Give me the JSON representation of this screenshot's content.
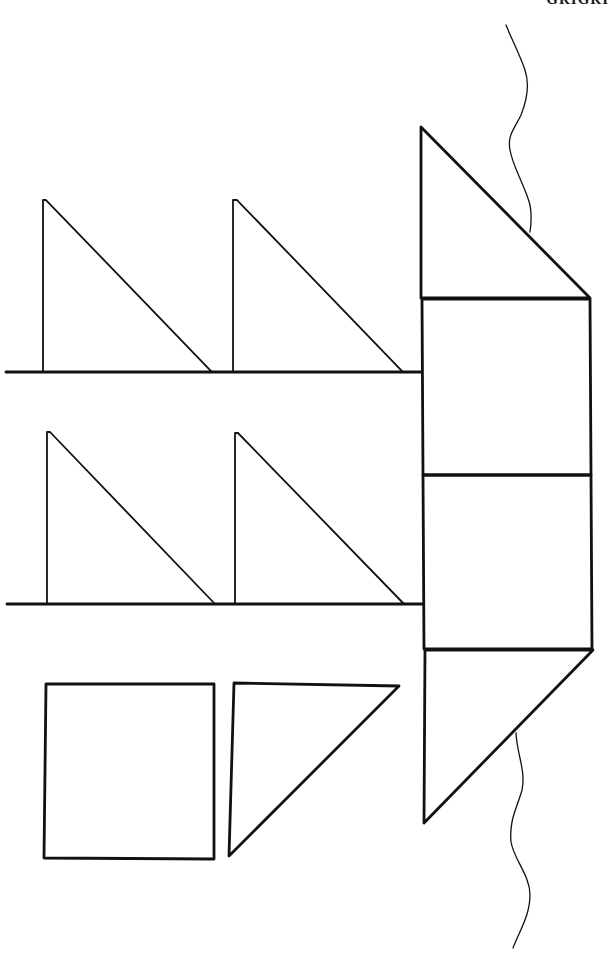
{
  "header": {
    "cut_off_text": "GRIGRI"
  },
  "diagram": {
    "type": "pattern-net",
    "stroke_color": "#111111",
    "background": "#ffffff",
    "central_column": {
      "pieces": [
        {
          "shape": "right-triangle",
          "label": "top-cap"
        },
        {
          "shape": "square",
          "label": "upper-square"
        },
        {
          "shape": "square",
          "label": "lower-square"
        },
        {
          "shape": "right-triangle",
          "label": "bottom-cap"
        }
      ]
    },
    "branches": [
      {
        "label": "upper-branch",
        "triangles": 2
      },
      {
        "label": "lower-branch",
        "triangles": 2
      }
    ],
    "loose_pieces": [
      {
        "shape": "square",
        "label": "loose-square"
      },
      {
        "shape": "right-triangle",
        "label": "loose-triangle"
      }
    ],
    "wavy_lines": 2
  }
}
